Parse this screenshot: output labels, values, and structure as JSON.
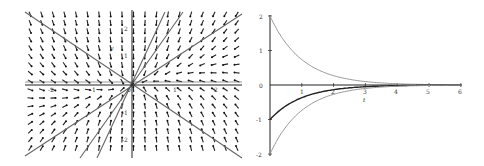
{
  "chart_data": [
    {
      "type": "vector_field",
      "title": "",
      "description": "Phase portrait of a stable node: direction-field arrows point toward the origin, with straight-line trajectories through the origin",
      "xlabel": "",
      "ylabel": "y",
      "xlim": [
        -2.2,
        2.2
      ],
      "ylim": [
        -2.2,
        2.2
      ],
      "x_ticks": [
        "-2",
        "-1",
        "0",
        "1",
        "2"
      ],
      "y_ticks": [
        "2",
        "1",
        "-1",
        "-2"
      ],
      "origin_label": "0",
      "straight_line_solutions": [
        {
          "slope": -1
        },
        {
          "slope": 0.6
        },
        {
          "slope": 1.8
        },
        {
          "slope": 3.0
        }
      ],
      "grid": false
    },
    {
      "type": "line",
      "title": "",
      "xlabel": "t",
      "ylabel": "",
      "xlim": [
        0,
        6
      ],
      "ylim": [
        -2,
        2
      ],
      "x_ticks": [
        "1",
        "2",
        "3",
        "4",
        "5",
        "6"
      ],
      "y_ticks": [
        "2",
        "1",
        "0",
        "-1",
        "-2"
      ],
      "series": [
        {
          "name": "upper",
          "style": "light",
          "x": [
            0,
            0.5,
            1,
            1.5,
            2,
            3,
            4,
            5,
            6
          ],
          "y": [
            2.0,
            1.21,
            0.74,
            0.45,
            0.27,
            0.1,
            0.04,
            0.01,
            0.0
          ]
        },
        {
          "name": "middle",
          "style": "dark",
          "x": [
            0,
            0.5,
            1,
            1.5,
            2,
            3,
            4,
            5,
            6
          ],
          "y": [
            -1.0,
            -0.61,
            -0.37,
            -0.22,
            -0.14,
            -0.05,
            -0.02,
            -0.01,
            0.0
          ]
        },
        {
          "name": "lower",
          "style": "light",
          "x": [
            0,
            0.5,
            1,
            1.5,
            2,
            3,
            4,
            5,
            6
          ],
          "y": [
            -2.0,
            -1.21,
            -0.74,
            -0.45,
            -0.27,
            -0.1,
            -0.04,
            -0.01,
            0.0
          ]
        }
      ],
      "grid": false
    }
  ],
  "labels": {
    "left": {
      "xt": [
        "-2",
        "-1",
        "1",
        "2"
      ],
      "yt": [
        "2",
        "1",
        "-1",
        "-2"
      ],
      "origin": "0",
      "ylab": "y"
    },
    "right": {
      "xt": [
        "1",
        "2",
        "3",
        "4",
        "5",
        "6"
      ],
      "yt": [
        "2",
        "1",
        "0",
        "-1",
        "-2"
      ],
      "tlab": "t"
    }
  }
}
